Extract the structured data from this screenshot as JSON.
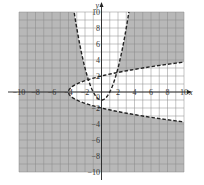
{
  "chart_data": {
    "type": "line",
    "title": "",
    "xlabel": "x",
    "ylabel": "y",
    "xlim": [
      -10,
      10
    ],
    "ylim": [
      -10,
      10
    ],
    "grid": true,
    "grid_step": 1,
    "x_ticks": [
      -10,
      -8,
      -6,
      -4,
      -2,
      2,
      4,
      6,
      8,
      10
    ],
    "x_tick_labels": [
      "−10",
      "−8",
      "−6",
      "−4",
      "−2",
      "2",
      "4",
      "6",
      "8",
      "10"
    ],
    "y_ticks": [
      10,
      8,
      6,
      4,
      2,
      -2,
      -4,
      -6,
      -8,
      -10
    ],
    "y_tick_labels": [
      "10",
      "8",
      "6",
      "4",
      "2",
      "−2",
      "−4",
      "−6",
      "−8",
      "−10"
    ],
    "origin_label": "0",
    "series": [
      {
        "name": "upward parabola",
        "equation": "y = x^2 - 1",
        "style": "dashed",
        "vertex": [
          0,
          -1
        ],
        "points": [
          [
            -3.32,
            10
          ],
          [
            -3,
            8
          ],
          [
            -2,
            3
          ],
          [
            -1,
            0
          ],
          [
            0,
            -1
          ],
          [
            1,
            0
          ],
          [
            2,
            3
          ],
          [
            3,
            8
          ],
          [
            3.32,
            10
          ]
        ]
      },
      {
        "name": "sideways parabola",
        "equation": "x = y^2 - 4",
        "style": "dashed",
        "vertex": [
          -4,
          0
        ],
        "points": [
          [
            10,
            3.74
          ],
          [
            5,
            3
          ],
          [
            0,
            2
          ],
          [
            -3,
            1
          ],
          [
            -4,
            0
          ],
          [
            -3,
            -1
          ],
          [
            0,
            -2
          ],
          [
            5,
            -3
          ],
          [
            10,
            -3.74
          ]
        ]
      }
    ],
    "shading": {
      "shaded_color": "#b8b8b8",
      "unshaded_color": "#ffffff",
      "unshaded_regions": [
        "inside upward parabola (y > x^2 - 1)",
        "inside sideways parabola (x > y^2 - 4)"
      ],
      "shaded_region": "outside both parabolas"
    },
    "colors": {
      "curve": "#222222",
      "grid": "#888888",
      "axis": "#222222"
    }
  }
}
